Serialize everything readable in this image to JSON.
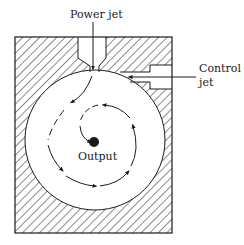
{
  "diagram": {
    "type": "fluidic vortex amplifier cross-section",
    "labels": {
      "power_jet": "Power jet",
      "control_jet_line1": "Control",
      "control_jet_line2": "jet",
      "output": "Output"
    },
    "colors": {
      "stroke": "#1a1a1a",
      "background": "#ffffff"
    }
  }
}
